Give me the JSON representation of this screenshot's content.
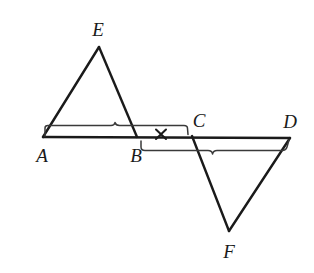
{
  "figure": {
    "type": "geometry-diagram",
    "width": 314,
    "height": 273,
    "background_color": "#ffffff",
    "stroke_color": "#1a1a1a",
    "brace_color": "#3a3a3a"
  },
  "labels": {
    "A": "A",
    "B": "B",
    "C": "C",
    "D": "D",
    "E": "E",
    "F": "F"
  },
  "label_positions": {
    "A": {
      "x": 42,
      "y": 155
    },
    "B": {
      "x": 136,
      "y": 155
    },
    "C": {
      "x": 199,
      "y": 120
    },
    "D": {
      "x": 290,
      "y": 121
    },
    "E": {
      "x": 98,
      "y": 29
    },
    "F": {
      "x": 229,
      "y": 251
    }
  },
  "points": {
    "A": {
      "x": 43,
      "y": 137
    },
    "B": {
      "x": 137,
      "y": 137
    },
    "C": {
      "x": 192,
      "y": 136
    },
    "D": {
      "x": 290,
      "y": 138
    },
    "E": {
      "x": 99,
      "y": 47
    },
    "F": {
      "x": 229,
      "y": 231
    }
  },
  "segments": [
    {
      "name": "baseline-AD",
      "from": "A",
      "to": "D"
    },
    {
      "name": "side-AE",
      "from": "A",
      "to": "E"
    },
    {
      "name": "side-EB",
      "from": "E",
      "to": "B"
    },
    {
      "name": "side-CF",
      "from": "C",
      "to": "F"
    },
    {
      "name": "side-FD",
      "from": "F",
      "to": "D"
    }
  ],
  "braces": [
    {
      "name": "brace-AC",
      "spans": "A to C",
      "position": "above-baseline",
      "start_x": 45,
      "end_x": 190,
      "y": 126,
      "peak_x": 116
    },
    {
      "name": "brace-BD",
      "spans": "B to D",
      "position": "below-baseline",
      "start_x": 141,
      "end_x": 289,
      "y": 150,
      "peak_x": 213
    }
  ],
  "tick_marks": [
    {
      "name": "cross-tick-BC",
      "glyph": "x",
      "x": 161,
      "y": 134,
      "meaning": "congruence mark on segment between B and C"
    }
  ]
}
